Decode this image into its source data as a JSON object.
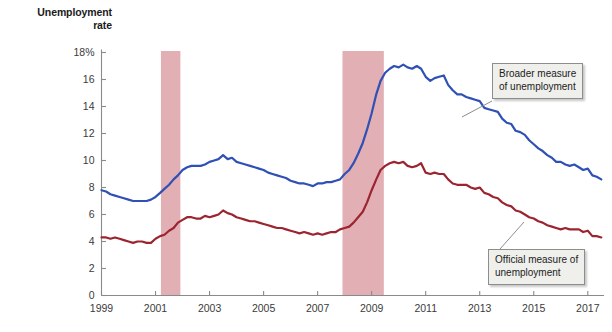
{
  "axis_title": {
    "line1": "Unemployment",
    "line2": "rate"
  },
  "annotations": {
    "broader": {
      "line1": "Broader measure",
      "line2": "of unemployment"
    },
    "official": {
      "line1": "Official measure of",
      "line2": "unemployment"
    }
  },
  "colors": {
    "broader_line": "#2f50b4",
    "official_line": "#9c2430",
    "recession_band": "#e2afb5",
    "axis": "#8a8a8a",
    "tick_text": "#3b3b3b",
    "callout_fill": "#efefeb",
    "callout_border": "#8d8d8d",
    "background": "#ffffff"
  },
  "chart_data": {
    "type": "line",
    "title": "",
    "xlabel": "",
    "ylabel": "Unemployment rate",
    "xlim": [
      1999,
      2017.6
    ],
    "ylim": [
      0,
      18
    ],
    "grid": false,
    "legend_position": "annotated-callouts",
    "ytick_labels": [
      "0",
      "2",
      "4",
      "6",
      "8",
      "10",
      "12",
      "14",
      "16",
      "18%"
    ],
    "ytick_values": [
      0,
      2,
      4,
      6,
      8,
      10,
      12,
      14,
      16,
      18
    ],
    "xtick_labels": [
      "1999",
      "2001",
      "2003",
      "2005",
      "2007",
      "2009",
      "2011",
      "2013",
      "2015",
      "2017"
    ],
    "xtick_values": [
      1999,
      2001,
      2003,
      2005,
      2007,
      2009,
      2011,
      2013,
      2015,
      2017
    ],
    "shaded_regions": [
      {
        "label": "recession-2001",
        "x_start": 2001.2,
        "x_end": 2001.92
      },
      {
        "label": "recession-2008",
        "x_start": 2007.92,
        "x_end": 2009.45
      }
    ],
    "series": [
      {
        "name": "Broader measure of unemployment",
        "color": "#2f50b4",
        "x": [
          1999.0,
          1999.17,
          1999.33,
          1999.5,
          1999.67,
          1999.83,
          2000.0,
          2000.17,
          2000.33,
          2000.5,
          2000.67,
          2000.83,
          2001.0,
          2001.17,
          2001.33,
          2001.5,
          2001.67,
          2001.83,
          2002.0,
          2002.17,
          2002.33,
          2002.5,
          2002.67,
          2002.83,
          2003.0,
          2003.17,
          2003.33,
          2003.5,
          2003.67,
          2003.83,
          2004.0,
          2004.17,
          2004.33,
          2004.5,
          2004.67,
          2004.83,
          2005.0,
          2005.17,
          2005.33,
          2005.5,
          2005.67,
          2005.83,
          2006.0,
          2006.17,
          2006.33,
          2006.5,
          2006.67,
          2006.83,
          2007.0,
          2007.17,
          2007.33,
          2007.5,
          2007.67,
          2007.83,
          2008.0,
          2008.17,
          2008.33,
          2008.5,
          2008.67,
          2008.83,
          2009.0,
          2009.17,
          2009.33,
          2009.5,
          2009.67,
          2009.83,
          2010.0,
          2010.17,
          2010.33,
          2010.5,
          2010.67,
          2010.83,
          2011.0,
          2011.17,
          2011.33,
          2011.5,
          2011.67,
          2011.83,
          2012.0,
          2012.17,
          2012.33,
          2012.5,
          2012.67,
          2012.83,
          2013.0,
          2013.17,
          2013.33,
          2013.5,
          2013.67,
          2013.83,
          2014.0,
          2014.17,
          2014.33,
          2014.5,
          2014.67,
          2014.83,
          2015.0,
          2015.17,
          2015.33,
          2015.5,
          2015.67,
          2015.83,
          2016.0,
          2016.17,
          2016.33,
          2016.5,
          2016.67,
          2016.83,
          2017.0,
          2017.17,
          2017.33,
          2017.5
        ],
        "y": [
          7.8,
          7.7,
          7.5,
          7.4,
          7.3,
          7.2,
          7.1,
          7.0,
          7.0,
          7.0,
          7.0,
          7.1,
          7.3,
          7.6,
          7.9,
          8.2,
          8.6,
          8.9,
          9.3,
          9.5,
          9.6,
          9.6,
          9.6,
          9.7,
          9.9,
          10.0,
          10.1,
          10.4,
          10.1,
          10.2,
          9.9,
          9.8,
          9.7,
          9.6,
          9.5,
          9.4,
          9.3,
          9.1,
          9.0,
          8.9,
          8.8,
          8.7,
          8.5,
          8.4,
          8.3,
          8.3,
          8.2,
          8.1,
          8.3,
          8.3,
          8.4,
          8.4,
          8.5,
          8.6,
          9.0,
          9.3,
          9.8,
          10.5,
          11.3,
          12.3,
          13.5,
          14.9,
          15.9,
          16.5,
          16.8,
          17.0,
          16.9,
          17.1,
          16.9,
          16.8,
          17.0,
          16.8,
          16.2,
          15.9,
          16.1,
          16.2,
          16.3,
          15.6,
          15.2,
          14.9,
          14.9,
          14.7,
          14.6,
          14.5,
          14.4,
          13.9,
          13.8,
          13.7,
          13.6,
          13.1,
          12.8,
          12.7,
          12.2,
          12.1,
          11.9,
          11.5,
          11.2,
          10.9,
          10.7,
          10.4,
          10.2,
          9.9,
          9.9,
          9.7,
          9.6,
          9.7,
          9.5,
          9.3,
          9.4,
          8.9,
          8.8,
          8.6
        ],
        "endpoint_value": 8.7,
        "peak_value": 17.1,
        "peak_year": 2010.6
      },
      {
        "name": "Official measure of unemployment",
        "color": "#9c2430",
        "x": [
          1999.0,
          1999.17,
          1999.33,
          1999.5,
          1999.67,
          1999.83,
          2000.0,
          2000.17,
          2000.33,
          2000.5,
          2000.67,
          2000.83,
          2001.0,
          2001.17,
          2001.33,
          2001.5,
          2001.67,
          2001.83,
          2002.0,
          2002.17,
          2002.33,
          2002.5,
          2002.67,
          2002.83,
          2003.0,
          2003.17,
          2003.33,
          2003.5,
          2003.67,
          2003.83,
          2004.0,
          2004.17,
          2004.33,
          2004.5,
          2004.67,
          2004.83,
          2005.0,
          2005.17,
          2005.33,
          2005.5,
          2005.67,
          2005.83,
          2006.0,
          2006.17,
          2006.33,
          2006.5,
          2006.67,
          2006.83,
          2007.0,
          2007.17,
          2007.33,
          2007.5,
          2007.67,
          2007.83,
          2008.0,
          2008.17,
          2008.33,
          2008.5,
          2008.67,
          2008.83,
          2009.0,
          2009.17,
          2009.33,
          2009.5,
          2009.67,
          2009.83,
          2010.0,
          2010.17,
          2010.33,
          2010.5,
          2010.67,
          2010.83,
          2011.0,
          2011.17,
          2011.33,
          2011.5,
          2011.67,
          2011.83,
          2012.0,
          2012.17,
          2012.33,
          2012.5,
          2012.67,
          2012.83,
          2013.0,
          2013.17,
          2013.33,
          2013.5,
          2013.67,
          2013.83,
          2014.0,
          2014.17,
          2014.33,
          2014.5,
          2014.67,
          2014.83,
          2015.0,
          2015.17,
          2015.33,
          2015.5,
          2015.67,
          2015.83,
          2016.0,
          2016.17,
          2016.33,
          2016.5,
          2016.67,
          2016.83,
          2017.0,
          2017.17,
          2017.33,
          2017.5
        ],
        "y": [
          4.3,
          4.3,
          4.2,
          4.3,
          4.2,
          4.1,
          4.0,
          3.9,
          4.0,
          4.0,
          3.9,
          3.9,
          4.2,
          4.4,
          4.5,
          4.8,
          5.0,
          5.4,
          5.6,
          5.8,
          5.8,
          5.7,
          5.7,
          5.9,
          5.8,
          5.9,
          6.0,
          6.3,
          6.1,
          6.0,
          5.8,
          5.7,
          5.6,
          5.5,
          5.5,
          5.4,
          5.3,
          5.2,
          5.1,
          5.0,
          5.0,
          4.9,
          4.8,
          4.7,
          4.6,
          4.7,
          4.6,
          4.5,
          4.6,
          4.5,
          4.6,
          4.7,
          4.7,
          4.9,
          5.0,
          5.1,
          5.4,
          5.8,
          6.2,
          6.9,
          7.8,
          8.6,
          9.3,
          9.6,
          9.8,
          9.9,
          9.8,
          9.9,
          9.6,
          9.5,
          9.6,
          9.8,
          9.1,
          9.0,
          9.1,
          9.0,
          9.0,
          8.6,
          8.3,
          8.2,
          8.2,
          8.2,
          8.0,
          7.9,
          8.0,
          7.6,
          7.5,
          7.3,
          7.2,
          6.9,
          6.7,
          6.6,
          6.3,
          6.2,
          6.0,
          5.8,
          5.7,
          5.5,
          5.4,
          5.2,
          5.1,
          5.0,
          4.9,
          5.0,
          4.9,
          4.9,
          4.9,
          4.7,
          4.8,
          4.4,
          4.4,
          4.3
        ],
        "endpoint_value": 4.4,
        "peak_value": 10.0,
        "peak_year": 2009.83
      }
    ]
  }
}
